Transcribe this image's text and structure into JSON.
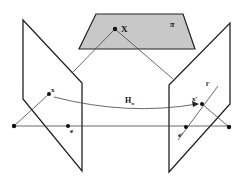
{
  "figure": {
    "colors": {
      "line": "#222222",
      "plane_fill": "#c8c8c8",
      "ray": "#444444",
      "background": "#ffffff"
    },
    "labels": {
      "world_point": "X",
      "plane": "π",
      "image_point_left": "x",
      "epipole_left": "e",
      "homography": "H",
      "homography_sub": "π",
      "image_point_right": "x",
      "image_point_right_prime": "′",
      "epipole_right": "e",
      "epipole_right_prime": "′",
      "epipolar_line": "l",
      "epipolar_line_prime": "′"
    }
  }
}
